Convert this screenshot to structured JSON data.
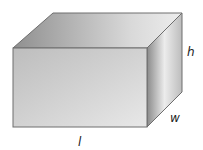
{
  "diagram": {
    "labels": {
      "height": "h",
      "width": "w",
      "length": "l"
    },
    "colors": {
      "edge": "#6e6e6e",
      "front_light": "#d8d8d8",
      "front_dark": "#a9a9a9",
      "top_light": "#e6e6e6",
      "top_dark": "#9a9a9a",
      "side_light": "#f2f2f2",
      "side_dark": "#a0a0a0"
    }
  }
}
